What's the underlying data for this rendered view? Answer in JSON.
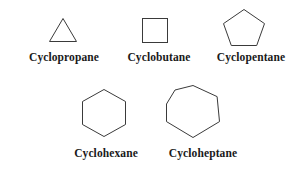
{
  "figure": {
    "background_color": "#ffffff",
    "stroke_color": "#3a3a3a",
    "label_color": "#1a1a1a",
    "stroke_width": 1
  },
  "rows": [
    {
      "items": [
        {
          "label": "Cyclopropane",
          "shape": "triangle",
          "sides": 3,
          "icon": "triangle-icon"
        },
        {
          "label": "Cyclobutane",
          "shape": "square",
          "sides": 4,
          "icon": "square-icon"
        },
        {
          "label": "Cyclopentane",
          "shape": "pentagon",
          "sides": 5,
          "icon": "pentagon-icon"
        }
      ]
    },
    {
      "items": [
        {
          "label": "Cyclohexane",
          "shape": "hexagon",
          "sides": 6,
          "icon": "hexagon-icon"
        },
        {
          "label": "Cycloheptane",
          "shape": "heptagon",
          "sides": 7,
          "icon": "heptagon-icon"
        }
      ]
    }
  ]
}
